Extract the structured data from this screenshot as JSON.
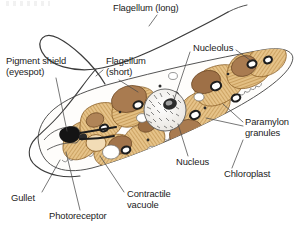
{
  "figure": {
    "organism": "Euglena",
    "labels": [
      {
        "id": "flagellum-long",
        "text": "Flagellum (long)",
        "x": 113,
        "y": 4,
        "align": "left"
      },
      {
        "id": "pigment-shield",
        "text": "Pigment shield",
        "x": 6,
        "y": 58,
        "align": "left"
      },
      {
        "id": "pigment-shield2",
        "text": "(eyespot)",
        "x": 6,
        "y": 68,
        "align": "left"
      },
      {
        "id": "flagellum-short",
        "text": "Flagellum",
        "x": 105,
        "y": 58,
        "align": "left"
      },
      {
        "id": "flagellum-short2",
        "text": "(short)",
        "x": 105,
        "y": 68,
        "align": "left"
      },
      {
        "id": "nucleolus",
        "text": "Nucleolus",
        "x": 192,
        "y": 44,
        "align": "left"
      },
      {
        "id": "paramylon",
        "text": "Paramylon",
        "x": 245,
        "y": 118,
        "align": "left"
      },
      {
        "id": "paramylon2",
        "text": "granules",
        "x": 245,
        "y": 128,
        "align": "left"
      },
      {
        "id": "nucleus",
        "text": "Nucleus",
        "x": 176,
        "y": 158,
        "align": "left"
      },
      {
        "id": "chloroplast",
        "text": "Chloroplast",
        "x": 222,
        "y": 170,
        "align": "left"
      },
      {
        "id": "gullet",
        "text": "Gullet",
        "x": 10,
        "y": 194,
        "align": "left"
      },
      {
        "id": "contractile",
        "text": "Contractile",
        "x": 126,
        "y": 190,
        "align": "left"
      },
      {
        "id": "contractile2",
        "text": "vacuole",
        "x": 126,
        "y": 200,
        "align": "left"
      },
      {
        "id": "photoreceptor",
        "text": "Photoreceptor",
        "x": 48,
        "y": 212,
        "align": "left"
      }
    ],
    "colors": {
      "background": "#ffffff",
      "outline": "#3a3a3a",
      "leader_line": "#4a4a4a",
      "text": "#222222",
      "chloroplast_fill": "#e6c389",
      "chloroplast_hatch": "#b98b45",
      "chloroplast_edge": "#8c6129",
      "organelle_brown": "#a97b50",
      "organelle_brown_dark": "#7d5530",
      "nucleus_fill": "#f3f1ee",
      "nucleus_speckle": "#555555",
      "nucleolus_fill": "#2b2b2b",
      "eyespot_black": "#141414",
      "vacuole_white": "#ffffff",
      "granule_ring": "#1d1d1d",
      "cytoplasm": "#fefdfb"
    },
    "structures": [
      {
        "name": "flagellum-long",
        "kind": "filament",
        "note": "long looping whip extending from anterior to upper-left and trailing right"
      },
      {
        "name": "flagellum-short",
        "kind": "filament",
        "note": "short rod near reservoir"
      },
      {
        "name": "pigment-shield",
        "kind": "eyespot",
        "note": "solid black crescent-shaped eyespot at anterior"
      },
      {
        "name": "photoreceptor",
        "kind": "organelle",
        "note": "swelling at base of long flagellum"
      },
      {
        "name": "gullet",
        "kind": "opening",
        "note": "anterior funnel-shaped invagination"
      },
      {
        "name": "contractile-vacuole",
        "kind": "vacuole",
        "note": "pale circular vacuole near anterior"
      },
      {
        "name": "nucleus",
        "kind": "nucleus",
        "note": "large speckled central sphere"
      },
      {
        "name": "nucleolus",
        "kind": "nucleolus",
        "note": "dark body inside nucleus"
      },
      {
        "name": "chloroplast",
        "kind": "plastid",
        "note": "elongated tan hatched ribbon plastids radiating through cell"
      },
      {
        "name": "paramylon-granules",
        "kind": "granule",
        "note": "dark ring-shaped storage bodies embedded in chloroplasts"
      },
      {
        "name": "pellicle",
        "kind": "membrane",
        "note": "striated outer covering along lower margin"
      }
    ]
  }
}
